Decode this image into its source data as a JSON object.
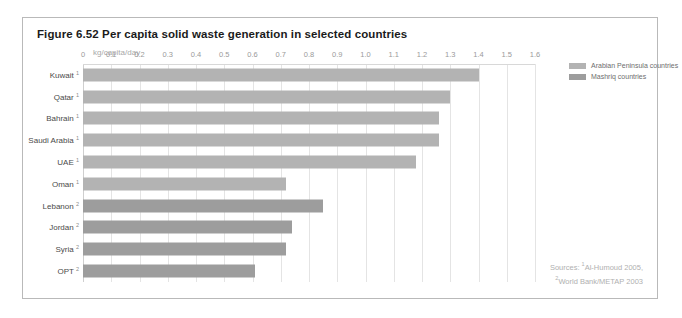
{
  "figure": {
    "title": "Figure 6.52 Per capita solid waste generation in selected countries",
    "axis_unit": "kg/capita/day",
    "sources_prefix": "Sources: ",
    "source_1_marker": "1",
    "source_1": "Al-Humoud 2005,",
    "source_2_marker": "2",
    "source_2": "World Bank/METAP 2003"
  },
  "legend": {
    "position": "right",
    "items": [
      {
        "label": "Arabian Peninsula countries",
        "color": "#b3b3b3",
        "group": "g1"
      },
      {
        "label": "Mashriq countries",
        "color": "#9d9d9d",
        "group": "g2"
      }
    ]
  },
  "chart_data": {
    "type": "bar",
    "orientation": "horizontal",
    "title": "Figure 6.52 Per capita solid waste generation in selected countries",
    "xlabel": "kg/capita/day",
    "ylabel": "",
    "xlim": [
      0,
      1.6
    ],
    "xticks": [
      "0",
      "0.1",
      "0.2",
      "0.3",
      "0.4",
      "0.5",
      "0.6",
      "0.7",
      "0.8",
      "0.9",
      "1.0",
      "1.1",
      "1.2",
      "1.3",
      "1.4",
      "1.5",
      "1.6"
    ],
    "xtick_values": [
      0,
      0.1,
      0.2,
      0.3,
      0.4,
      0.5,
      0.6,
      0.7,
      0.8,
      0.9,
      1.0,
      1.1,
      1.2,
      1.3,
      1.4,
      1.5,
      1.6
    ],
    "grid": true,
    "categories": [
      "Kuwait",
      "Qatar",
      "Bahrain",
      "Saudi Arabia",
      "UAE",
      "Oman",
      "Lebanon",
      "Jordan",
      "Syria",
      "OPT"
    ],
    "footnotes": [
      "1",
      "1",
      "1",
      "1",
      "1",
      "1",
      "2",
      "2",
      "2",
      "2"
    ],
    "groups": [
      "g1",
      "g1",
      "g1",
      "g1",
      "g1",
      "g1",
      "g2",
      "g2",
      "g2",
      "g2"
    ],
    "values": [
      1.4,
      1.3,
      1.26,
      1.26,
      1.18,
      0.72,
      0.85,
      0.74,
      0.72,
      0.61
    ],
    "series": [
      {
        "name": "Arabian Peninsula countries",
        "color": "#b3b3b3"
      },
      {
        "name": "Mashriq countries",
        "color": "#9d9d9d"
      }
    ]
  }
}
